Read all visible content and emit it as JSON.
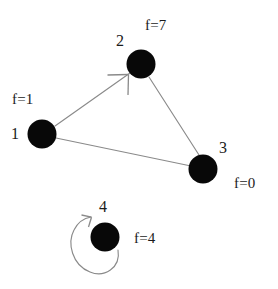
{
  "diagram": {
    "background_color": "#ffffff",
    "node_color": "#080808",
    "edge_color": "#8a8a8a",
    "text_color": "#1b1b1b",
    "nodes": [
      {
        "id": "node-1",
        "id_label": "1",
        "f_label": "f=1",
        "cx": 42,
        "cy": 134,
        "r": 14,
        "id_label_x": 11,
        "id_label_y": 126,
        "f_label_x": 12,
        "f_label_y": 92
      },
      {
        "id": "node-2",
        "id_label": "2",
        "f_label": "f=7",
        "cx": 141,
        "cy": 64,
        "r": 14,
        "id_label_x": 116,
        "id_label_y": 33,
        "f_label_x": 145,
        "f_label_y": 18
      },
      {
        "id": "node-3",
        "id_label": "3",
        "f_label": "f=0",
        "cx": 203,
        "cy": 169,
        "r": 14,
        "id_label_x": 219,
        "id_label_y": 140,
        "f_label_x": 234,
        "f_label_y": 176
      },
      {
        "id": "node-4",
        "id_label": "4",
        "f_label": "f=4",
        "cx": 105,
        "cy": 237,
        "r": 14,
        "id_label_x": 99,
        "id_label_y": 199,
        "f_label_x": 134,
        "f_label_y": 231
      }
    ],
    "edges": [
      {
        "id": "edge-1-2",
        "from": "1",
        "to": "2",
        "directed": true,
        "x1": 55,
        "y1": 126,
        "x2": 129,
        "y2": 74
      },
      {
        "id": "edge-1-3",
        "from": "1",
        "to": "3",
        "directed": false,
        "x1": 56,
        "y1": 138,
        "x2": 190,
        "y2": 166
      },
      {
        "id": "edge-2-3",
        "from": "2",
        "to": "3",
        "directed": false,
        "x1": 149,
        "y1": 77,
        "x2": 199,
        "y2": 154
      },
      {
        "id": "edge-4-4",
        "from": "4",
        "to": "4",
        "directed": true,
        "self_loop": true
      }
    ]
  }
}
